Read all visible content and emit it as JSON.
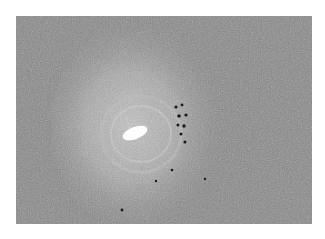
{
  "image": {
    "subject": "grayscale histology micrograph",
    "colors": {
      "background": "#ffffff",
      "tissue_base": "#8a8a8a",
      "stroma_light": "#b4b4b4",
      "lumen": "#ffffff",
      "pigment_cells": "#1a1a1a"
    }
  }
}
